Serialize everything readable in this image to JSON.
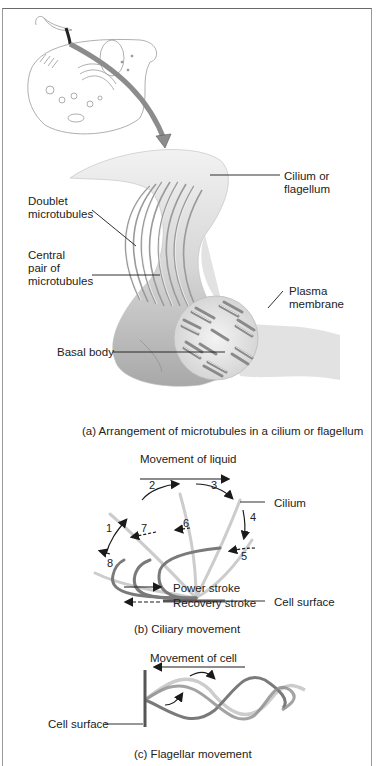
{
  "figure": {
    "panels": [
      {
        "id": "a",
        "caption": "(a) Arrangement of microtubules in a cilium or flagellum",
        "labels": {
          "cilium_or_flagellum_1": "Cilium or",
          "cilium_or_flagellum_2": "flagellum",
          "doublet_1": "Doublet",
          "doublet_2": "microtubules",
          "central_1": "Central",
          "central_2": "pair of",
          "central_3": "microtubules",
          "plasma_1": "Plasma",
          "plasma_2": "membrane",
          "basal_body": "Basal body"
        }
      },
      {
        "id": "b",
        "caption": "(b) Ciliary movement",
        "labels": {
          "movement": "Movement of liquid",
          "cilium": "Cilium",
          "cell_surface": "Cell surface",
          "power_stroke": "Power stroke",
          "recovery_stroke": "Recovery stroke"
        },
        "stroke_numbers": [
          "1",
          "2",
          "3",
          "4",
          "5",
          "6",
          "7",
          "8"
        ]
      },
      {
        "id": "c",
        "caption": "(c) Flagellar movement",
        "labels": {
          "movement": "Movement of cell",
          "cell_surface": "Cell surface"
        }
      }
    ],
    "colors": {
      "line": "#1a1a1a",
      "cilium_dark": "#7a7a7a",
      "cilium_light": "#cccccc",
      "arrow_fill": "#8c8c8c"
    }
  }
}
